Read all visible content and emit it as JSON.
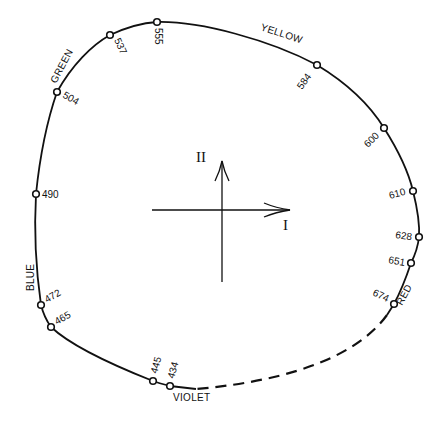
{
  "diagram": {
    "title": "",
    "axes": {
      "horizontal_label": "I",
      "vertical_label": "II"
    },
    "color_regions": [
      {
        "name": "GREEN"
      },
      {
        "name": "YELLOW"
      },
      {
        "name": "BLUE"
      },
      {
        "name": "RED"
      },
      {
        "name": "VIOLET"
      }
    ],
    "wavelength_points": [
      {
        "label": "555"
      },
      {
        "label": "537"
      },
      {
        "label": "504"
      },
      {
        "label": "490"
      },
      {
        "label": "472"
      },
      {
        "label": "465"
      },
      {
        "label": "445"
      },
      {
        "label": "434"
      },
      {
        "label": "584"
      },
      {
        "label": "600"
      },
      {
        "label": "610"
      },
      {
        "label": "628"
      },
      {
        "label": "651"
      },
      {
        "label": "674"
      }
    ],
    "line_color": "#111111",
    "background": "#ffffff"
  }
}
